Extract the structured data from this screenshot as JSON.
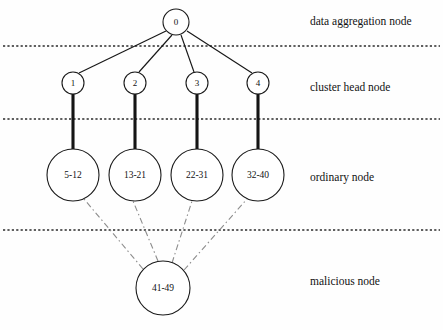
{
  "figure": {
    "width": 443,
    "height": 330,
    "background_color": "#fefefe"
  },
  "tier_labels": [
    {
      "text": "data aggregation node",
      "x": 310,
      "y": 22
    },
    {
      "text": "cluster head node",
      "x": 310,
      "y": 88
    },
    {
      "text": "ordinary node",
      "x": 310,
      "y": 178
    },
    {
      "text": "malicious node",
      "x": 310,
      "y": 282
    }
  ],
  "dividers": [
    {
      "y": 46,
      "x1": 3,
      "x2": 440
    },
    {
      "y": 119,
      "x1": 3,
      "x2": 440
    },
    {
      "y": 230,
      "x1": 3,
      "x2": 440
    }
  ],
  "nodes": {
    "aggregation": [
      {
        "id": "root",
        "label": "0",
        "cx": 176,
        "cy": 22,
        "r": 13,
        "label_size": "small"
      }
    ],
    "cluster_heads": [
      {
        "id": "ch1",
        "label": "1",
        "cx": 73,
        "cy": 83,
        "r": 11,
        "label_size": "small"
      },
      {
        "id": "ch2",
        "label": "2",
        "cx": 135,
        "cy": 83,
        "r": 11,
        "label_size": "small"
      },
      {
        "id": "ch3",
        "label": "3",
        "cx": 197,
        "cy": 83,
        "r": 11,
        "label_size": "small"
      },
      {
        "id": "ch4",
        "label": "4",
        "cx": 258,
        "cy": 83,
        "r": 11,
        "label_size": "small"
      }
    ],
    "ordinary": [
      {
        "id": "on1",
        "label": "5-12",
        "cx": 73,
        "cy": 175,
        "r": 26,
        "label_size": "medium"
      },
      {
        "id": "on2",
        "label": "13-21",
        "cx": 135,
        "cy": 175,
        "r": 26,
        "label_size": "medium"
      },
      {
        "id": "on3",
        "label": "22-31",
        "cx": 197,
        "cy": 175,
        "r": 26,
        "label_size": "medium"
      },
      {
        "id": "on4",
        "label": "32-40",
        "cx": 258,
        "cy": 175,
        "r": 26,
        "label_size": "medium"
      }
    ],
    "malicious": [
      {
        "id": "mal",
        "label": "41-49",
        "cx": 163,
        "cy": 288,
        "r": 27,
        "label_size": "medium"
      }
    ]
  },
  "edges": {
    "aggregation_to_cluster": [
      {
        "from": "root",
        "to": "ch1",
        "x1": 166,
        "y1": 31,
        "x2": 79,
        "y2": 73,
        "style": "thin"
      },
      {
        "from": "root",
        "to": "ch2",
        "x1": 172,
        "y1": 35,
        "x2": 139,
        "y2": 72,
        "style": "thin"
      },
      {
        "from": "root",
        "to": "ch3",
        "x1": 181,
        "y1": 35,
        "x2": 194,
        "y2": 72,
        "style": "thin"
      },
      {
        "from": "root",
        "to": "ch4",
        "x1": 187,
        "y1": 31,
        "x2": 252,
        "y2": 73,
        "style": "thin"
      }
    ],
    "cluster_to_ordinary": [
      {
        "from": "ch1",
        "to": "on1",
        "x1": 73,
        "y1": 94,
        "x2": 73,
        "y2": 149,
        "style": "thick"
      },
      {
        "from": "ch2",
        "to": "on2",
        "x1": 135,
        "y1": 94,
        "x2": 135,
        "y2": 149,
        "style": "thick"
      },
      {
        "from": "ch3",
        "to": "on3",
        "x1": 197,
        "y1": 94,
        "x2": 197,
        "y2": 149,
        "style": "thick"
      },
      {
        "from": "ch4",
        "to": "on4",
        "x1": 258,
        "y1": 94,
        "x2": 258,
        "y2": 149,
        "style": "thick"
      }
    ],
    "malicious_to_ordinary": [
      {
        "from": "mal",
        "to": "on1",
        "x1": 143,
        "y1": 269,
        "x2": 84,
        "y2": 199,
        "style": "dashdot"
      },
      {
        "from": "mal",
        "to": "on2",
        "x1": 158,
        "y1": 261,
        "x2": 133,
        "y2": 201,
        "style": "dashdot"
      },
      {
        "from": "mal",
        "to": "on3",
        "x1": 172,
        "y1": 263,
        "x2": 192,
        "y2": 201,
        "style": "dashdot"
      },
      {
        "from": "mal",
        "to": "on4",
        "x1": 184,
        "y1": 270,
        "x2": 247,
        "y2": 199,
        "style": "dashdot"
      }
    ]
  },
  "colors": {
    "node_stroke": "#1a1a1a",
    "node_fill": "#ffffff",
    "thin_edge": "#171717",
    "thick_edge": "#141414",
    "dashdot_edge": "#8d8d8d",
    "divider": "#2b2b2b",
    "text": "#121212"
  }
}
